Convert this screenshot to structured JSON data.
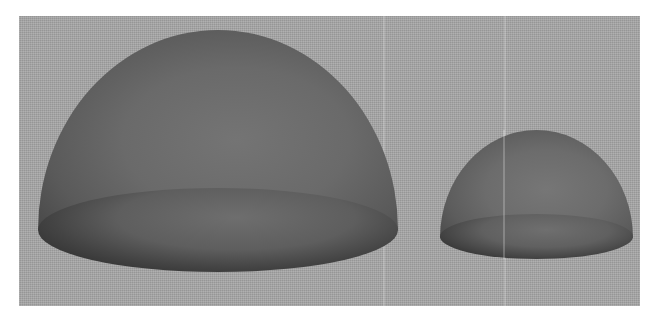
{
  "scene": {
    "description": "Two gray hemispheres (domes) on a gray textured background",
    "background_color": "#a7a7a7",
    "objects": [
      {
        "name": "large-hemisphere",
        "shade": "#6a6a6a",
        "edge_shade": "#3e3e3e"
      },
      {
        "name": "small-hemisphere",
        "shade": "#6c6c6c",
        "edge_shade": "#404040"
      }
    ]
  }
}
